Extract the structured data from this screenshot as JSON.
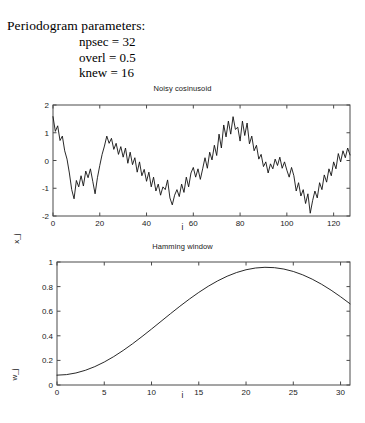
{
  "header": {
    "title": "Periodogram parameters:",
    "params": [
      "npsec = 32",
      "overl = 0.5",
      "knew = 16"
    ]
  },
  "chart_data": [
    {
      "type": "line",
      "name": "noisy-cosinusoid",
      "title": "Noisy cosinusoid",
      "xlabel": "i",
      "ylabel": "x_j",
      "xlim": [
        0,
        127
      ],
      "ylim": [
        -2,
        2
      ],
      "xticks": [
        0,
        20,
        40,
        60,
        80,
        100,
        120
      ],
      "yticks": [
        -2,
        -1,
        0,
        1,
        2
      ],
      "xticklabels": [
        "0",
        "20",
        "40",
        "60",
        "80",
        "100",
        "120"
      ],
      "yticklabels": [
        "-2",
        "-1",
        "0",
        "1",
        "2"
      ],
      "grid": false,
      "legend": null,
      "x": [
        0,
        1,
        2,
        3,
        4,
        5,
        6,
        7,
        8,
        9,
        10,
        11,
        12,
        13,
        14,
        15,
        16,
        17,
        18,
        19,
        20,
        21,
        22,
        23,
        24,
        25,
        26,
        27,
        28,
        29,
        30,
        31,
        32,
        33,
        34,
        35,
        36,
        37,
        38,
        39,
        40,
        41,
        42,
        43,
        44,
        45,
        46,
        47,
        48,
        49,
        50,
        51,
        52,
        53,
        54,
        55,
        56,
        57,
        58,
        59,
        60,
        61,
        62,
        63,
        64,
        65,
        66,
        67,
        68,
        69,
        70,
        71,
        72,
        73,
        74,
        75,
        76,
        77,
        78,
        79,
        80,
        81,
        82,
        83,
        84,
        85,
        86,
        87,
        88,
        89,
        90,
        91,
        92,
        93,
        94,
        95,
        96,
        97,
        98,
        99,
        100,
        101,
        102,
        103,
        104,
        105,
        106,
        107,
        108,
        109,
        110,
        111,
        112,
        113,
        114,
        115,
        116,
        117,
        118,
        119,
        120,
        121,
        122,
        123,
        124,
        125,
        126,
        127
      ],
      "values": [
        1.58,
        1.05,
        1.25,
        0.72,
        0.88,
        0.35,
        0.05,
        -0.45,
        -1.05,
        -1.38,
        -0.72,
        -0.95,
        -0.55,
        -0.92,
        -0.38,
        -0.62,
        -0.3,
        -0.75,
        -1.2,
        -0.62,
        -0.18,
        0.22,
        0.52,
        0.88,
        0.62,
        0.8,
        0.4,
        0.62,
        0.22,
        0.5,
        0.12,
        0.45,
        -0.1,
        0.3,
        -0.15,
        0.1,
        -0.42,
        -0.05,
        -0.55,
        -0.32,
        -0.75,
        -0.42,
        -0.95,
        -0.6,
        -1.1,
        -0.85,
        -1.25,
        -0.95,
        -1.05,
        -0.7,
        -1.35,
        -1.6,
        -1.25,
        -1.05,
        -1.3,
        -0.85,
        -1.15,
        -0.6,
        -0.95,
        -0.45,
        -0.25,
        -0.6,
        -0.3,
        -0.68,
        -0.3,
        0.1,
        -0.28,
        0.3,
        0.02,
        0.55,
        0.18,
        0.95,
        0.45,
        1.28,
        0.85,
        1.42,
        0.95,
        1.58,
        1.12,
        1.2,
        0.7,
        1.42,
        0.9,
        1.35,
        0.6,
        0.88,
        0.35,
        0.55,
        0.05,
        0.22,
        -0.22,
        -0.05,
        -0.45,
        -0.12,
        -0.3,
        0.05,
        -0.18,
        0.12,
        -0.28,
        -0.05,
        -0.35,
        -0.6,
        -0.25,
        -0.55,
        -1.1,
        -0.8,
        -1.28,
        -1.05,
        -1.55,
        -1.2,
        -1.9,
        -1.45,
        -1.1,
        -1.35,
        -0.8,
        -1.05,
        -0.52,
        -0.78,
        -0.3,
        -0.55,
        -0.05,
        -0.3,
        0.25,
        -0.05,
        0.35,
        0.1,
        0.45,
        0.2
      ],
      "series_note": "Random noisy cosine; amplitude roughly -2..2, period about 25 samples"
    },
    {
      "type": "line",
      "name": "hamming-window",
      "title": "Hamming window",
      "xlabel": "i",
      "ylabel": "w_j",
      "xlim": [
        0,
        31
      ],
      "ylim": [
        0,
        1
      ],
      "xticks": [
        0,
        5,
        10,
        15,
        20,
        25,
        30
      ],
      "yticks": [
        0,
        0.2,
        0.4,
        0.6,
        0.8,
        1
      ],
      "xticklabels": [
        "0",
        "5",
        "10",
        "15",
        "20",
        "25",
        "30"
      ],
      "yticklabels": [
        "0",
        "0.2",
        "0.4",
        "0.6",
        "0.8",
        "1"
      ],
      "grid": false,
      "legend": null,
      "formula": "w = 0.54 - 0.46*cos(2*pi*i/31)",
      "x": [
        0,
        1,
        2,
        3,
        4,
        5,
        6,
        7,
        8,
        9,
        10,
        11,
        12,
        13,
        14,
        15,
        16,
        17,
        18,
        19,
        20,
        21,
        22,
        23,
        24,
        25,
        26,
        27,
        28,
        29,
        30,
        31
      ],
      "values": [
        0.08,
        0.0844,
        0.0977,
        0.1194,
        0.1493,
        0.1867,
        0.2308,
        0.2808,
        0.3356,
        0.394,
        0.4549,
        0.5171,
        0.5792,
        0.64,
        0.6982,
        0.7528,
        0.8026,
        0.8467,
        0.8842,
        0.9145,
        0.937,
        0.9511,
        0.9568,
        0.954,
        0.9427,
        0.9231,
        0.8955,
        0.8604,
        0.8186,
        0.7707,
        0.7177,
        0.6606
      ]
    }
  ]
}
